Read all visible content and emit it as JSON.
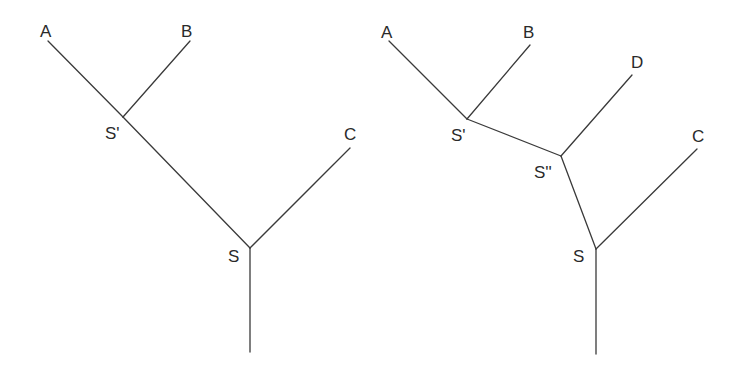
{
  "trees": [
    {
      "name": "left-tree",
      "nodes": [
        {
          "id": "A",
          "label": "A",
          "x": 48,
          "y": 41,
          "lx": 40,
          "ly": 37
        },
        {
          "id": "B",
          "label": "B",
          "x": 190,
          "y": 41,
          "lx": 181,
          "ly": 37
        },
        {
          "id": "Sp",
          "label": "S'",
          "x": 123,
          "y": 117,
          "lx": 105,
          "ly": 139
        },
        {
          "id": "C",
          "label": "C",
          "x": 350,
          "y": 148,
          "lx": 344,
          "ly": 140
        },
        {
          "id": "S",
          "label": "S",
          "x": 250,
          "y": 248,
          "lx": 228,
          "ly": 262
        },
        {
          "id": "root",
          "label": "",
          "x": 250,
          "y": 352
        }
      ],
      "edges": [
        [
          "A",
          "Sp"
        ],
        [
          "B",
          "Sp"
        ],
        [
          "Sp",
          "S"
        ],
        [
          "C",
          "S"
        ],
        [
          "S",
          "root"
        ]
      ]
    },
    {
      "name": "right-tree",
      "nodes": [
        {
          "id": "A",
          "label": "A",
          "x": 389,
          "y": 41,
          "lx": 381,
          "ly": 38
        },
        {
          "id": "B",
          "label": "B",
          "x": 530,
          "y": 45,
          "lx": 523,
          "ly": 38
        },
        {
          "id": "D",
          "label": "D",
          "x": 632,
          "y": 75,
          "lx": 631,
          "ly": 68
        },
        {
          "id": "Sp",
          "label": "S'",
          "x": 467,
          "y": 119,
          "lx": 451,
          "ly": 141
        },
        {
          "id": "Spp",
          "label": "S''",
          "x": 561,
          "y": 156,
          "lx": 534,
          "ly": 178
        },
        {
          "id": "C",
          "label": "C",
          "x": 697,
          "y": 149,
          "lx": 692,
          "ly": 142
        },
        {
          "id": "S",
          "label": "S",
          "x": 596,
          "y": 249,
          "lx": 573,
          "ly": 262
        },
        {
          "id": "root",
          "label": "",
          "x": 596,
          "y": 354
        }
      ],
      "edges": [
        [
          "A",
          "Sp"
        ],
        [
          "B",
          "Sp"
        ],
        [
          "Sp",
          "Spp"
        ],
        [
          "D",
          "Spp"
        ],
        [
          "Spp",
          "S"
        ],
        [
          "C",
          "S"
        ],
        [
          "S",
          "root"
        ]
      ]
    }
  ]
}
